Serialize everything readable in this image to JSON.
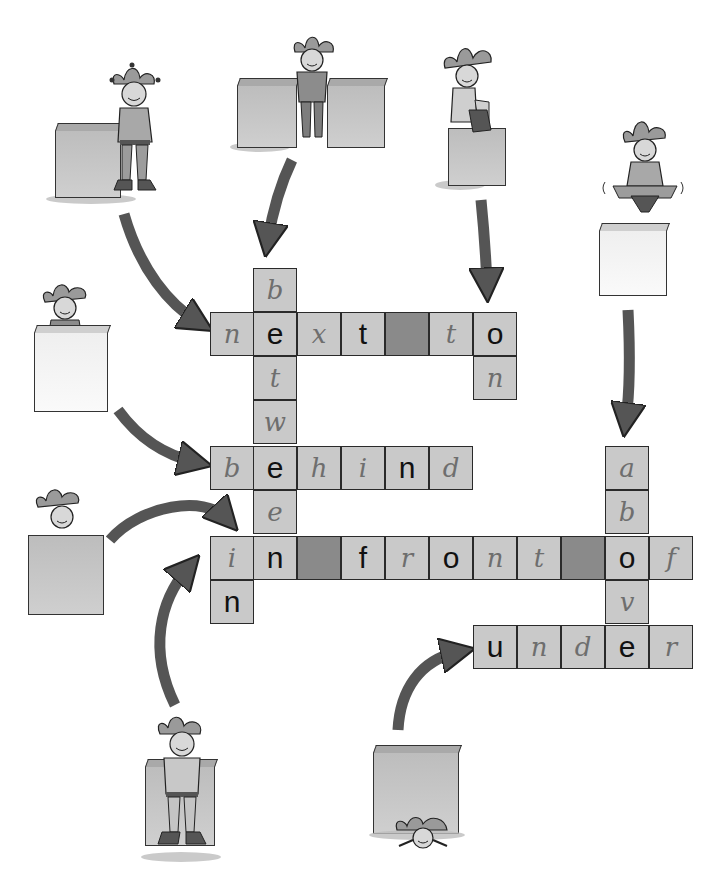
{
  "puzzle": {
    "title": "Prepositions crossword",
    "words": [
      {
        "id": "next-to",
        "text": "next to",
        "direction": "across",
        "row_y": 312,
        "start_x": 210
      },
      {
        "id": "on",
        "text": "on",
        "direction": "down",
        "col_x": 473,
        "start_y": 312
      },
      {
        "id": "between",
        "text": "between",
        "direction": "down",
        "col_x": 253,
        "start_y": 268
      },
      {
        "id": "behind",
        "text": "behind",
        "direction": "across",
        "row_y": 446,
        "start_x": 210
      },
      {
        "id": "in",
        "text": "in",
        "direction": "down",
        "col_x": 210,
        "start_y": 536
      },
      {
        "id": "in-front-of",
        "text": "in front of",
        "direction": "across",
        "row_y": 536,
        "start_x": 210
      },
      {
        "id": "above",
        "text": "above",
        "direction": "down",
        "col_x": 605,
        "start_y": 446
      },
      {
        "id": "under",
        "text": "under",
        "direction": "across",
        "row_y": 625,
        "start_x": 473
      }
    ],
    "cells": [
      {
        "x": 253,
        "y": 268,
        "ch": "b",
        "style": "hand"
      },
      {
        "x": 210,
        "y": 312,
        "ch": "n",
        "style": "hand"
      },
      {
        "x": 253,
        "y": 312,
        "ch": "e",
        "style": "filled"
      },
      {
        "x": 297,
        "y": 312,
        "ch": "x",
        "style": "hand"
      },
      {
        "x": 341,
        "y": 312,
        "ch": "t",
        "style": "filled"
      },
      {
        "x": 385,
        "y": 312,
        "ch": "",
        "style": "dark"
      },
      {
        "x": 429,
        "y": 312,
        "ch": "t",
        "style": "hand"
      },
      {
        "x": 473,
        "y": 312,
        "ch": "o",
        "style": "filled"
      },
      {
        "x": 473,
        "y": 356,
        "ch": "n",
        "style": "hand"
      },
      {
        "x": 253,
        "y": 356,
        "ch": "t",
        "style": "hand"
      },
      {
        "x": 253,
        "y": 400,
        "ch": "w",
        "style": "hand"
      },
      {
        "x": 210,
        "y": 446,
        "ch": "b",
        "style": "hand"
      },
      {
        "x": 253,
        "y": 446,
        "ch": "e",
        "style": "filled"
      },
      {
        "x": 297,
        "y": 446,
        "ch": "h",
        "style": "hand"
      },
      {
        "x": 341,
        "y": 446,
        "ch": "i",
        "style": "hand"
      },
      {
        "x": 385,
        "y": 446,
        "ch": "n",
        "style": "filled"
      },
      {
        "x": 429,
        "y": 446,
        "ch": "d",
        "style": "hand"
      },
      {
        "x": 253,
        "y": 490,
        "ch": "e",
        "style": "hand"
      },
      {
        "x": 210,
        "y": 536,
        "ch": "i",
        "style": "hand"
      },
      {
        "x": 253,
        "y": 536,
        "ch": "n",
        "style": "filled"
      },
      {
        "x": 297,
        "y": 536,
        "ch": "",
        "style": "dark"
      },
      {
        "x": 341,
        "y": 536,
        "ch": "f",
        "style": "filled"
      },
      {
        "x": 385,
        "y": 536,
        "ch": "r",
        "style": "hand"
      },
      {
        "x": 429,
        "y": 536,
        "ch": "o",
        "style": "filled"
      },
      {
        "x": 473,
        "y": 536,
        "ch": "n",
        "style": "hand"
      },
      {
        "x": 517,
        "y": 536,
        "ch": "t",
        "style": "hand"
      },
      {
        "x": 561,
        "y": 536,
        "ch": "",
        "style": "dark"
      },
      {
        "x": 605,
        "y": 536,
        "ch": "o",
        "style": "filled"
      },
      {
        "x": 649,
        "y": 536,
        "ch": "f",
        "style": "hand"
      },
      {
        "x": 210,
        "y": 580,
        "ch": "n",
        "style": "filled"
      },
      {
        "x": 605,
        "y": 446,
        "ch": "a",
        "style": "hand"
      },
      {
        "x": 605,
        "y": 490,
        "ch": "b",
        "style": "hand"
      },
      {
        "x": 605,
        "y": 580,
        "ch": "v",
        "style": "hand"
      },
      {
        "x": 473,
        "y": 625,
        "ch": "u",
        "style": "filled"
      },
      {
        "x": 517,
        "y": 625,
        "ch": "n",
        "style": "hand"
      },
      {
        "x": 561,
        "y": 625,
        "ch": "d",
        "style": "hand"
      },
      {
        "x": 605,
        "y": 625,
        "ch": "e",
        "style": "filled"
      },
      {
        "x": 649,
        "y": 625,
        "ch": "r",
        "style": "hand"
      }
    ]
  },
  "scenes": [
    {
      "id": "next-to",
      "label": "jester next to a box"
    },
    {
      "id": "between",
      "label": "jester between two boxes"
    },
    {
      "id": "on",
      "label": "jester sitting on a box"
    },
    {
      "id": "above",
      "label": "jester floating above a box"
    },
    {
      "id": "behind",
      "label": "jester behind a box"
    },
    {
      "id": "in",
      "label": "jester in a box"
    },
    {
      "id": "in-front-of",
      "label": "jester in front of a box"
    },
    {
      "id": "under",
      "label": "jester under a box"
    }
  ],
  "colors": {
    "cell": "#c9c9c9",
    "cell_blocked": "#8a8a8a",
    "arrow": "#555555",
    "box_grey": "#c4c4c4",
    "box_white": "#f5f5f5",
    "outline": "#2a2a2a"
  }
}
